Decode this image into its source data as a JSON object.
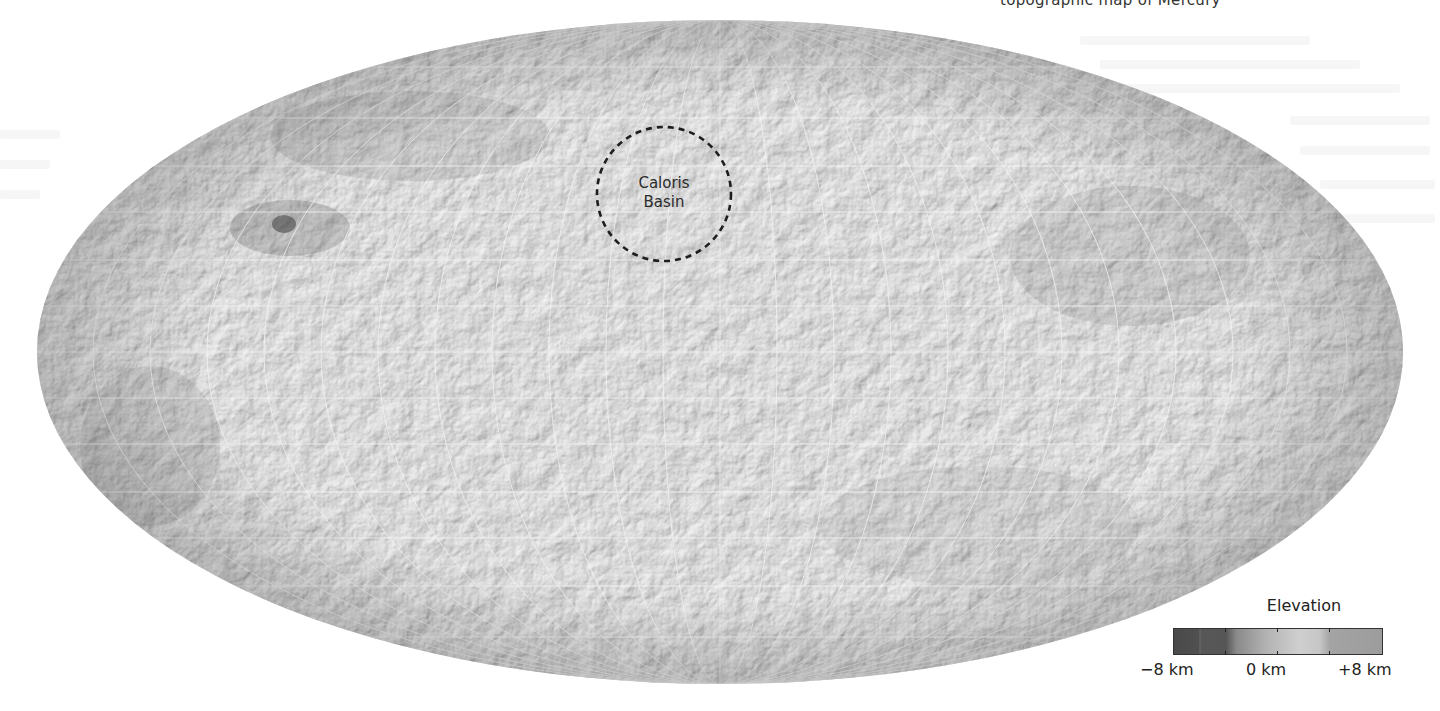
{
  "caption_fragment": "topographic map of Mercury",
  "map": {
    "title": "Mercury topographic map (Mollweide projection)",
    "projection": "mollweide",
    "graticule": true,
    "features": [
      {
        "name": "Caloris Basin",
        "label_line1": "Caloris",
        "label_line2": "Basin",
        "marker": "dashed-circle",
        "color": "#222222"
      }
    ]
  },
  "legend": {
    "title": "Elevation",
    "min_label": "−8 km",
    "mid_label": "0 km",
    "max_label": "+8 km",
    "colors": {
      "low": "#4a4a4a",
      "low_mid": "#575757",
      "mid_low": "#9a9a9a",
      "mid": "#d2d2d2",
      "high": "#9c9c9c"
    }
  },
  "colors": {
    "background": "#ffffff",
    "surface_light": "#cfcfcf",
    "surface_mid": "#a8a8a8",
    "surface_dark": "#6c6c6c",
    "graticule": "#f2f2f2"
  }
}
